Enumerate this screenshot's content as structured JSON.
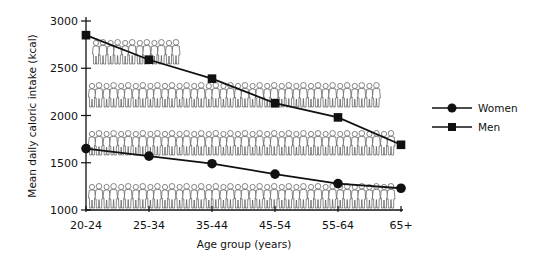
{
  "chart_data": {
    "type": "line",
    "title": "",
    "xlabel": "Age group (years)",
    "ylabel": "Mean daily caloric intake (kcal)",
    "categories": [
      "20-24",
      "25-34",
      "35-44",
      "45-54",
      "55-64",
      "65+"
    ],
    "series": [
      {
        "name": "Women",
        "marker": "circle",
        "values": [
          1650,
          1570,
          1490,
          1380,
          1280,
          1230
        ]
      },
      {
        "name": "Men",
        "marker": "square",
        "values": [
          2850,
          2590,
          2390,
          2130,
          1980,
          1690
        ]
      }
    ],
    "ylim": [
      1000,
      3000
    ],
    "yticks": [
      1000,
      1500,
      2000,
      2500,
      3000
    ],
    "grid": false,
    "legend_position": "right",
    "background": "rows of human figure silhouettes (pairs of men and women)"
  },
  "colors": {
    "line": "#111111",
    "figure_outline": "#555555",
    "background": "#ffffff"
  }
}
